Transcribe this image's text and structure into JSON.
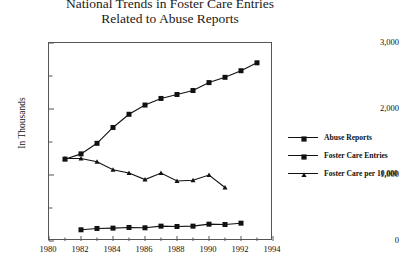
{
  "chart_data": {
    "type": "line",
    "title": "National Trends in Foster Care Entries Related to Abuse Reports",
    "title_line1": "National Trends in Foster Care Entries",
    "title_line2": "Related to Abuse Reports",
    "xlabel": "",
    "ylabel": "In Thousands",
    "xlim": [
      1980,
      1994
    ],
    "ylim": [
      0,
      3000
    ],
    "grid": false,
    "legend_position": "right",
    "y_ticks": [
      0,
      1000,
      2000,
      3000
    ],
    "y_tick_labels": [
      "0",
      "1,000",
      "2,000",
      "3,000"
    ],
    "y_minor_ticks": [
      500,
      1500,
      2500
    ],
    "x_ticks": [
      1980,
      1982,
      1984,
      1986,
      1988,
      1990,
      1992,
      1994
    ],
    "x_tick_labels": [
      "1980",
      "1982",
      "1984",
      "1986",
      "1988",
      "1990",
      "1992",
      "1994"
    ],
    "x_minor_ticks": [
      1981,
      1983,
      1985,
      1987,
      1989,
      1991,
      1993
    ],
    "series": [
      {
        "name": "Abuse Reports",
        "marker": "square",
        "color": "#111111",
        "x": [
          1981,
          1982,
          1983,
          1984,
          1985,
          1986,
          1987,
          1988,
          1989,
          1990,
          1991,
          1992,
          1993
        ],
        "values": [
          1240,
          1320,
          1480,
          1720,
          1920,
          2060,
          2160,
          2220,
          2280,
          2400,
          2480,
          2580,
          2700
        ]
      },
      {
        "name": "Foster Care Entries",
        "marker": "square",
        "color": "#111111",
        "x": [
          1982,
          1983,
          1984,
          1985,
          1986,
          1987,
          1988,
          1989,
          1990,
          1991,
          1992
        ],
        "values": [
          170,
          190,
          195,
          205,
          200,
          225,
          220,
          225,
          255,
          250,
          270
        ]
      },
      {
        "name": "Foster Care per 10,000",
        "marker": "triangle",
        "color": "#111111",
        "x": [
          1981,
          1982,
          1983,
          1984,
          1985,
          1986,
          1987,
          1988,
          1989,
          1990,
          1991
        ],
        "values": [
          1250,
          1250,
          1200,
          1080,
          1030,
          930,
          1030,
          910,
          920,
          1000,
          810
        ]
      }
    ]
  }
}
